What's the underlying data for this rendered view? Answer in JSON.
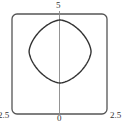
{
  "chart_data": {
    "type": "line",
    "title": "",
    "xlabel": "",
    "ylabel": "",
    "xlim": [
      -2.5,
      2.5
    ],
    "ylim": [
      0,
      5
    ],
    "grid": false,
    "legend": null,
    "tick_labels": {
      "top": "5",
      "bottom": "0",
      "left": "2.5",
      "right": "2.5"
    },
    "series": [
      {
        "name": "closed curve",
        "shape": "rounded diamond (superellipse-like closed curve)",
        "center": [
          0.0,
          3.13
        ],
        "x_extent": [
          -1.6,
          1.66
        ],
        "y_extent": [
          1.55,
          4.7
        ],
        "exponent": 1.6
      }
    ],
    "axes": {
      "vertical_axis_at_x": 0,
      "frame": "rounded rectangle"
    }
  },
  "colors": {
    "frame": "#555555",
    "axis": "#888888",
    "curve": "#333333",
    "text": "#333333"
  },
  "layout": {
    "frame": {
      "x0": 12,
      "y0": 14,
      "x1": 107,
      "y1": 114,
      "radius": 5
    }
  }
}
